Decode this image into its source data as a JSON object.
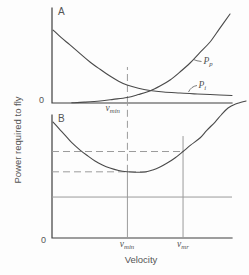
{
  "figure": {
    "background": "#fdfdfd",
    "curve_color": "#4a4a4a",
    "axis_color": "#3f3f3f",
    "guide_color": "#9b9b9b",
    "text_color": "#555555"
  },
  "chart_data": {
    "type": "line",
    "title": "",
    "xlabel": "Velocity",
    "ylabel": "Power required to fly",
    "origin_tick": "0",
    "x_axis": {
      "min": 0,
      "max": 100,
      "units": "arbitrary",
      "grid": false
    },
    "y_axis": {
      "min": 0,
      "max": 100,
      "units": "arbitrary",
      "grid": false
    },
    "legend_position": "inline-curve-labels",
    "panels": [
      {
        "id": "A",
        "letter": "A",
        "series": [
          {
            "name": "induced-power",
            "label": {
              "base": "P",
              "sub": "i"
            },
            "points": [
              [
                0.6,
                76.8
              ],
              [
                5,
                69
              ],
              [
                10,
                61.1
              ],
              [
                15.6,
                52
              ],
              [
                21.1,
                43.2
              ],
              [
                26.7,
                35.5
              ],
              [
                32.2,
                28.4
              ],
              [
                37,
                23
              ],
              [
                41.7,
                18.9
              ],
              [
                48,
                15.5
              ],
              [
                54.4,
                13.2
              ],
              [
                62,
                11.6
              ],
              [
                71.1,
                10.5
              ],
              [
                79,
                9.6
              ],
              [
                87.8,
                8.9
              ],
              [
                100,
                7.9
              ]
            ]
          },
          {
            "name": "parasite-power",
            "label": {
              "base": "P",
              "sub": "p"
            },
            "points": [
              [
                11,
                0.2
              ],
              [
                18,
                0.9
              ],
              [
                26.7,
                2.1
              ],
              [
                34,
                3.8
              ],
              [
                41.7,
                5.8
              ],
              [
                48,
                8.9
              ],
              [
                54.4,
                12.6
              ],
              [
                60,
                17.8
              ],
              [
                65.6,
                24.2
              ],
              [
                71,
                32.5
              ],
              [
                76.7,
                42.1
              ],
              [
                82,
                52.8
              ],
              [
                87.8,
                64.2
              ],
              [
                93,
                78
              ],
              [
                98.9,
                93.7
              ]
            ]
          }
        ],
        "x_ticks": [
          {
            "label": {
              "base": "v",
              "sub": "min"
            },
            "u": 41.9
          }
        ],
        "guides": [
          {
            "orient": "v",
            "style": "dashed",
            "u": 41.9,
            "p_from": 0,
            "p_to": 37.9
          }
        ]
      },
      {
        "id": "B",
        "letter": "B",
        "series": [
          {
            "name": "total-power",
            "label": null,
            "points": [
              [
                0.6,
                94.3
              ],
              [
                4,
                88.8
              ],
              [
                7.2,
                83.7
              ],
              [
                11,
                77.5
              ],
              [
                15.6,
                71.5
              ],
              [
                20,
                66.6
              ],
              [
                23.9,
                62.6
              ],
              [
                28,
                59.4
              ],
              [
                32.2,
                56.9
              ],
              [
                37,
                54.9
              ],
              [
                41.7,
                53.8
              ],
              [
                46,
                53.4
              ],
              [
                51.7,
                53.7
              ],
              [
                56,
                55.3
              ],
              [
                60,
                57.7
              ],
              [
                64,
                60.9
              ],
              [
                68.3,
                65
              ],
              [
                72.8,
                70.3
              ],
              [
                77,
                75.5
              ],
              [
                82.2,
                81.3
              ],
              [
                86,
                87.5
              ],
              [
                90.6,
                94.3
              ],
              [
                94,
                100
              ],
              [
                97.8,
                105.7
              ],
              [
                102,
                108.9
              ],
              [
                107.8,
                111.4
              ]
            ]
          }
        ],
        "x_ticks": [
          {
            "label": {
              "base": "v",
              "sub": "min"
            },
            "u": 41.9
          },
          {
            "label": {
              "base": "v",
              "sub": "mr"
            },
            "u": 72.8
          }
        ],
        "guides": [
          {
            "orient": "v",
            "style": "dashed",
            "u": 41.9,
            "p_from": 53.8,
            "p_to": 108.9
          },
          {
            "orient": "v",
            "style": "solid",
            "u": 41.9,
            "p_from": 0,
            "p_to": 53.8
          },
          {
            "orient": "v",
            "style": "solid",
            "u": 72.8,
            "p_from": 0,
            "p_to": 82.9
          },
          {
            "orient": "h",
            "style": "dashed",
            "p": 70.3,
            "u_from": 0,
            "u_to": 72.8
          },
          {
            "orient": "h",
            "style": "dashed",
            "p": 53.8,
            "u_from": 0,
            "u_to": 54
          },
          {
            "orient": "h",
            "style": "solid",
            "p": 33.3,
            "u_from": 0,
            "u_to": 100
          }
        ]
      }
    ]
  }
}
